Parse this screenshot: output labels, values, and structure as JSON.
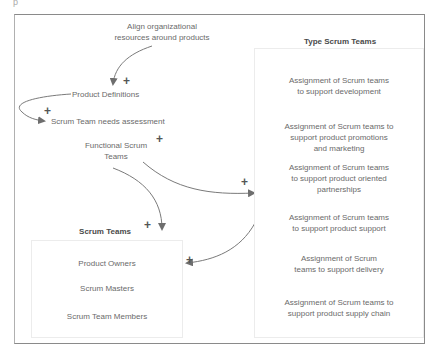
{
  "corner_mark": "p",
  "nodes": {
    "align": "Align organizational resources around products",
    "align_line1": "Align organizational",
    "align_line2": "resources around products",
    "product_definitions": "Product Definitions",
    "needs_assessment": "Scrum Team needs assessment",
    "functional_line1": "Functional Scrum",
    "functional_line2": "Teams"
  },
  "scrum_teams": {
    "title": "Scrum Teams",
    "items": [
      "Product Owners",
      "Scrum Masters",
      "Scrum Team Members"
    ]
  },
  "type_scrum_teams": {
    "title": "Type Scrum Teams",
    "items": [
      {
        "line1": "Assignment of Scrum teams",
        "line2": "to support development",
        "line3": ""
      },
      {
        "line1": "Assignment of Scrum teams to",
        "line2": "support product promotions",
        "line3": "and marketing"
      },
      {
        "line1": "Assignment of Scrum teams",
        "line2": "to support product oriented",
        "line3": "partnerships"
      },
      {
        "line1": "Assignment of Scrum teams",
        "line2": "to support product support",
        "line3": ""
      },
      {
        "line1": "Assignment of Scrum",
        "line2": "teams to support delivery",
        "line3": ""
      },
      {
        "line1": "Assignment of Scrum teams to",
        "line2": "support product supply chain",
        "line3": ""
      }
    ]
  },
  "polarity": {
    "plus": "+"
  },
  "colors": {
    "frame": "#8a8a8a",
    "arrow": "#6e6e6e",
    "text": "#6a6a6a",
    "heading": "#4a4a4a"
  }
}
